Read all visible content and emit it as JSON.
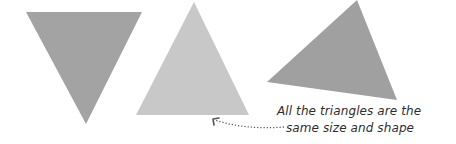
{
  "diagram": {
    "triangles": [
      {
        "name": "inverted-triangle",
        "orientation": "pointing down",
        "color": "#a3a3a3",
        "points": "26,12 142,12 86,124"
      },
      {
        "name": "upright-triangle",
        "orientation": "pointing up",
        "color": "#c8c8c8",
        "points": "194,2 136,115 249,115"
      },
      {
        "name": "rotated-triangle",
        "orientation": "rotated",
        "color": "#a0a0a0",
        "points": "357,0 267,82 397,100"
      }
    ],
    "caption": {
      "line1": "All the triangles are the",
      "line2": "same size and shape"
    },
    "arrow": {
      "style": "dotted",
      "color": "#555555",
      "path": "M284,127 Q245,130 215,120",
      "head": "M213,119 L219,118 M213,119 L214,125"
    }
  }
}
